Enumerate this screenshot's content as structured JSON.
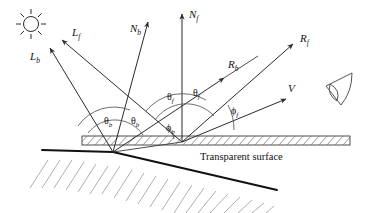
{
  "figure": {
    "caption": "Transparent surface",
    "background_color": "#ffffff",
    "line_color": "#2b2b2b",
    "arc_color": "#555555",
    "ground_color": "#111111",
    "hatch_color": "#9a9a9a"
  },
  "icons": {
    "sun": "sun-icon",
    "eye": "eye-icon"
  },
  "vectors": [
    {
      "id": "Lb",
      "base": "L",
      "sub": "b",
      "label_x": 30,
      "label_y": 60,
      "desc": "back-surface light direction"
    },
    {
      "id": "Lf",
      "base": "L",
      "sub": "f",
      "label_x": 72,
      "label_y": 36,
      "desc": "front-surface light direction"
    },
    {
      "id": "Nb",
      "base": "N",
      "sub": "b",
      "label_x": 130,
      "label_y": 32,
      "desc": "back-surface normal"
    },
    {
      "id": "Nf",
      "base": "N",
      "sub": "f",
      "label_x": 189,
      "label_y": 18,
      "desc": "front-surface normal"
    },
    {
      "id": "Rb",
      "base": "R",
      "sub": "b",
      "label_x": 228,
      "label_y": 68,
      "desc": "back-surface reflection"
    },
    {
      "id": "Rf",
      "base": "R",
      "sub": "f",
      "label_x": 300,
      "label_y": 42,
      "desc": "front-surface reflection"
    },
    {
      "id": "V",
      "base": "V",
      "sub": "",
      "label_x": 288,
      "label_y": 92,
      "desc": "view direction"
    }
  ],
  "angles": [
    {
      "id": "theta_b_1",
      "base": "θ",
      "sub": "b",
      "label_x": 104,
      "label_y": 124,
      "desc": "back incidence angle"
    },
    {
      "id": "theta_b_2",
      "base": "θ",
      "sub": "b",
      "label_x": 131,
      "label_y": 124,
      "desc": "back reflection angle"
    },
    {
      "id": "theta_f_1",
      "base": "θ",
      "sub": "f",
      "label_x": 167,
      "label_y": 100,
      "desc": "front incidence angle"
    },
    {
      "id": "theta_f_2",
      "base": "θ",
      "sub": "f",
      "label_x": 193,
      "label_y": 96,
      "desc": "front reflection angle"
    },
    {
      "id": "phi_b",
      "base": "ϕ",
      "sub": "b",
      "label_x": 170,
      "label_y": 131,
      "desc": "back view-relative angle"
    },
    {
      "id": "phi_f",
      "base": "ϕ",
      "sub": "f",
      "label_x": 231,
      "label_y": 114,
      "desc": "front view-relative angle"
    }
  ],
  "caption_position": {
    "x": 200,
    "y": 160
  }
}
